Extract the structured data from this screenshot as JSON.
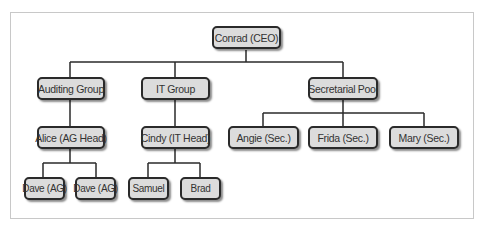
{
  "diagram": {
    "type": "org-chart",
    "nodes": {
      "ceo": "Conrad (CEO)",
      "auditing": "Auditing Group",
      "it": "IT Group",
      "secretarial": "Secretarial Pool",
      "alice": "Alice (AG Head)",
      "cindy": "Cindy (IT Head)",
      "angie": "Angie (Sec.)",
      "frida": "Frida (Sec.)",
      "mary": "Mary (Sec.)",
      "dave1": "Dave (AG)",
      "dave2": "Dave (AG)",
      "samuel": "Samuel",
      "brad": "Brad"
    },
    "edges": [
      [
        "Conrad (CEO)",
        "Auditing Group"
      ],
      [
        "Conrad (CEO)",
        "IT Group"
      ],
      [
        "Conrad (CEO)",
        "Secretarial Pool"
      ],
      [
        "Auditing Group",
        "Alice (AG Head)"
      ],
      [
        "IT Group",
        "Cindy (IT Head)"
      ],
      [
        "Secretarial Pool",
        "Angie (Sec.)"
      ],
      [
        "Secretarial Pool",
        "Frida (Sec.)"
      ],
      [
        "Secretarial Pool",
        "Mary (Sec.)"
      ],
      [
        "Alice (AG Head)",
        "Dave (AG)"
      ],
      [
        "Alice (AG Head)",
        "Dave (AG)"
      ],
      [
        "Cindy (IT Head)",
        "Samuel"
      ],
      [
        "Cindy (IT Head)",
        "Brad"
      ]
    ],
    "colors": {
      "node_fill": "#dcdcdc",
      "node_border": "#2a2a2a",
      "line": "#2a2a2a",
      "frame": "#c8c8c8"
    }
  }
}
